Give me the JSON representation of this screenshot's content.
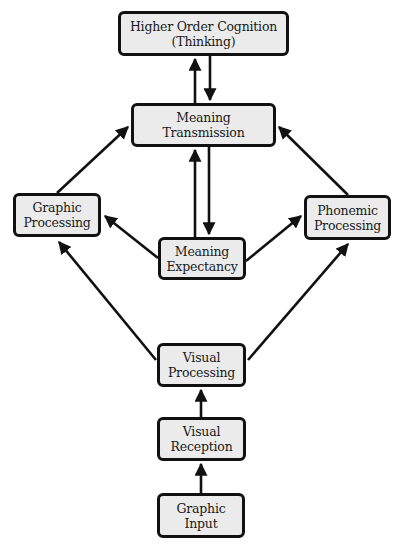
{
  "diagram": {
    "type": "flowchart",
    "colors": {
      "box_fill": "#ebebeb",
      "box_border": "#111111",
      "arrow": "#111111",
      "background": "#ffffff"
    },
    "nodes": {
      "higher_order_cognition": {
        "line1": "Higher Order Cognition",
        "line2": "(Thinking)"
      },
      "meaning_transmission": {
        "line1": "Meaning",
        "line2": "Transmission"
      },
      "graphic_processing": {
        "line1": "Graphic",
        "line2": "Processing"
      },
      "phonemic_processing": {
        "line1": "Phonemic",
        "line2": "Processing"
      },
      "meaning_expectancy": {
        "line1": "Meaning",
        "line2": "Expectancy"
      },
      "visual_processing": {
        "line1": "Visual",
        "line2": "Processing"
      },
      "visual_reception": {
        "line1": "Visual",
        "line2": "Reception"
      },
      "graphic_input": {
        "line1": "Graphic",
        "line2": "Input"
      }
    },
    "edges": [
      {
        "from": "Graphic Input",
        "to": "Visual Reception"
      },
      {
        "from": "Visual Reception",
        "to": "Visual Processing"
      },
      {
        "from": "Visual Processing",
        "to": "Graphic Processing"
      },
      {
        "from": "Visual Processing",
        "to": "Phonemic Processing"
      },
      {
        "from": "Meaning Expectancy",
        "to": "Graphic Processing"
      },
      {
        "from": "Meaning Expectancy",
        "to": "Phonemic Processing"
      },
      {
        "from": "Meaning Expectancy",
        "to": "Meaning Transmission"
      },
      {
        "from": "Meaning Transmission",
        "to": "Meaning Expectancy"
      },
      {
        "from": "Graphic Processing",
        "to": "Meaning Transmission"
      },
      {
        "from": "Phonemic Processing",
        "to": "Meaning Transmission"
      },
      {
        "from": "Meaning Transmission",
        "to": "Higher Order Cognition (Thinking)"
      },
      {
        "from": "Higher Order Cognition (Thinking)",
        "to": "Meaning Transmission"
      }
    ]
  }
}
